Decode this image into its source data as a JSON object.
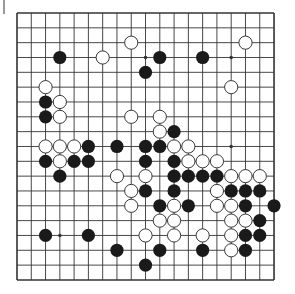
{
  "board": {
    "size": 19,
    "origin": {
      "x": 17,
      "y": 13
    },
    "spacing": {
      "x": 14.28,
      "y": 14.83
    },
    "line_color": "#333333",
    "background": "#ffffff",
    "stone_radius": 6.6,
    "colors": {
      "black": "#1a1a1a",
      "white_fill": "#ffffff",
      "white_stroke": "#222222"
    },
    "star_points": [
      [
        3,
        9
      ],
      [
        3,
        15
      ],
      [
        9,
        15
      ],
      [
        15,
        3
      ]
    ],
    "stones": {
      "black": [
        [
          3,
          3
        ],
        [
          3,
          10
        ],
        [
          3,
          13
        ],
        [
          4,
          9
        ],
        [
          6,
          2
        ],
        [
          7,
          2
        ],
        [
          8,
          11
        ],
        [
          9,
          5
        ],
        [
          9,
          7
        ],
        [
          9,
          9
        ],
        [
          9,
          10
        ],
        [
          10,
          2
        ],
        [
          10,
          4
        ],
        [
          10,
          5
        ],
        [
          10,
          9
        ],
        [
          10,
          11
        ],
        [
          11,
          3
        ],
        [
          11,
          11
        ],
        [
          11,
          12
        ],
        [
          11,
          13
        ],
        [
          11,
          14
        ],
        [
          12,
          9
        ],
        [
          12,
          11
        ],
        [
          12,
          15
        ],
        [
          12,
          16
        ],
        [
          12,
          17
        ],
        [
          13,
          10
        ],
        [
          13,
          12
        ],
        [
          13,
          16
        ],
        [
          13,
          18
        ],
        [
          14,
          17
        ],
        [
          15,
          2
        ],
        [
          15,
          5
        ],
        [
          15,
          16
        ],
        [
          15,
          17
        ],
        [
          16,
          7
        ],
        [
          16,
          10
        ],
        [
          16,
          13
        ],
        [
          16,
          16
        ],
        [
          17,
          9
        ]
      ],
      "white": [
        [
          2,
          8
        ],
        [
          2,
          16
        ],
        [
          3,
          6
        ],
        [
          5,
          2
        ],
        [
          5,
          15
        ],
        [
          6,
          3
        ],
        [
          7,
          3
        ],
        [
          7,
          8
        ],
        [
          7,
          10
        ],
        [
          8,
          10
        ],
        [
          9,
          2
        ],
        [
          9,
          3
        ],
        [
          9,
          4
        ],
        [
          9,
          11
        ],
        [
          9,
          12
        ],
        [
          10,
          3
        ],
        [
          10,
          12
        ],
        [
          10,
          13
        ],
        [
          10,
          14
        ],
        [
          11,
          7
        ],
        [
          11,
          9
        ],
        [
          11,
          15
        ],
        [
          11,
          16
        ],
        [
          11,
          17
        ],
        [
          12,
          8
        ],
        [
          12,
          14
        ],
        [
          13,
          8
        ],
        [
          13,
          11
        ],
        [
          13,
          14
        ],
        [
          13,
          15
        ],
        [
          14,
          10
        ],
        [
          14,
          11
        ],
        [
          14,
          15
        ],
        [
          14,
          16
        ],
        [
          15,
          9
        ],
        [
          15,
          11
        ],
        [
          15,
          13
        ],
        [
          15,
          15
        ],
        [
          16,
          15
        ]
      ]
    }
  }
}
